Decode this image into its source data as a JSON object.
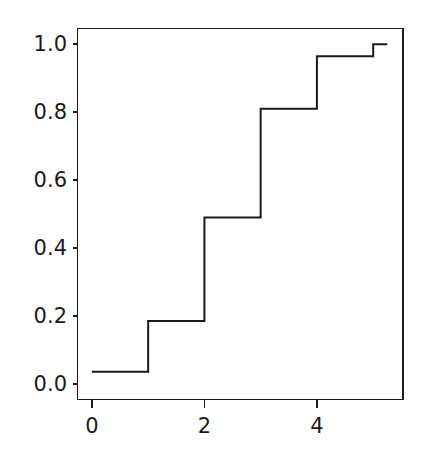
{
  "chart_data": {
    "type": "line",
    "subtype": "step-post",
    "title": "",
    "xlabel": "",
    "ylabel": "",
    "xlim": [
      -0.265,
      5.53
    ],
    "ylim": [
      -0.048,
      1.048
    ],
    "xticks": [
      0,
      2,
      4
    ],
    "xtick_labels": [
      "0",
      "2",
      "4"
    ],
    "yticks": [
      0.0,
      0.2,
      0.4,
      0.6,
      0.8,
      1.0
    ],
    "ytick_labels": [
      "0.0",
      "0.2",
      "0.4",
      "0.6",
      "0.8",
      "1.0"
    ],
    "grid": false,
    "legend": null,
    "line_color": "#1a1a1a",
    "line_width": 2.0,
    "background_color": "#ffffff",
    "series": [
      {
        "name": "cumulative",
        "x": [
          0,
          1,
          2,
          3,
          4,
          5,
          5.25
        ],
        "y": [
          0.035,
          0.185,
          0.49,
          0.81,
          0.965,
          1.0,
          1.0
        ],
        "steps": [
          {
            "x_start": 0,
            "x_end": 1,
            "y": 0.035
          },
          {
            "x_start": 1,
            "x_end": 2,
            "y": 0.185
          },
          {
            "x_start": 2,
            "x_end": 3,
            "y": 0.49
          },
          {
            "x_start": 3,
            "x_end": 4,
            "y": 0.81
          },
          {
            "x_start": 4,
            "x_end": 5,
            "y": 0.965
          },
          {
            "x_start": 5,
            "x_end": 5.25,
            "y": 1.0
          }
        ]
      }
    ]
  },
  "axes": {
    "spine_color": "#1a1a1a",
    "tick_color": "#1a1a1a",
    "tick_length": 4
  }
}
